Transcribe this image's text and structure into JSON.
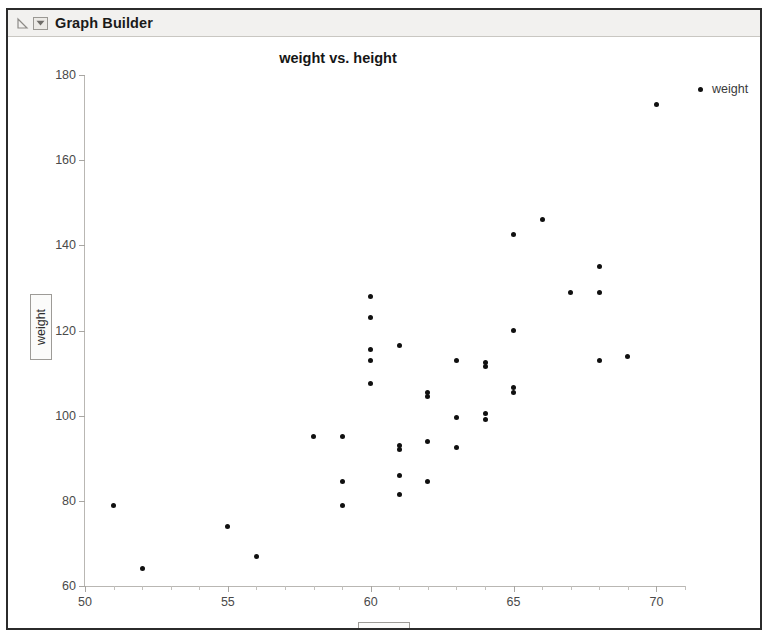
{
  "window": {
    "title": "Graph Builder",
    "disclosure_icon": "disclosure-triangle-icon",
    "popup_menu_icon": "red-triangle-popup-icon"
  },
  "chart_data": {
    "type": "scatter",
    "title": "weight vs. height",
    "xlabel": "height",
    "ylabel": "weight",
    "xlim": [
      50,
      71
    ],
    "ylim": [
      60,
      180
    ],
    "xticks": [
      50,
      55,
      60,
      65,
      70
    ],
    "yticks": [
      60,
      80,
      100,
      120,
      140,
      160,
      180
    ],
    "x_minor_tick_step": 1,
    "grid": false,
    "legend": {
      "position": "right",
      "entries": [
        {
          "name": "weight",
          "marker": "filled-circle",
          "color": "#101010"
        }
      ]
    },
    "series": [
      {
        "name": "weight",
        "color": "#101010",
        "points": [
          [
            51,
            79
          ],
          [
            52,
            64
          ],
          [
            55,
            74
          ],
          [
            56,
            67
          ],
          [
            58,
            95
          ],
          [
            59,
            95
          ],
          [
            59,
            79
          ],
          [
            59,
            84.5
          ],
          [
            60,
            128
          ],
          [
            60,
            123
          ],
          [
            60,
            113
          ],
          [
            60,
            115.5
          ],
          [
            60,
            107.5
          ],
          [
            61,
            116.5
          ],
          [
            61,
            81.5
          ],
          [
            61,
            86
          ],
          [
            61,
            92
          ],
          [
            61,
            93
          ],
          [
            62,
            104.5
          ],
          [
            62,
            105.5
          ],
          [
            62,
            84.5
          ],
          [
            62,
            94
          ],
          [
            63,
            92.5
          ],
          [
            63,
            113
          ],
          [
            63,
            99.5
          ],
          [
            64,
            100.5
          ],
          [
            64,
            111.5
          ],
          [
            64,
            112.5
          ],
          [
            64,
            99
          ],
          [
            65,
            142.5
          ],
          [
            65,
            120
          ],
          [
            65,
            105.5
          ],
          [
            65,
            106.5
          ],
          [
            66,
            146
          ],
          [
            67,
            129
          ],
          [
            68,
            135
          ],
          [
            68,
            129
          ],
          [
            68,
            113
          ],
          [
            69,
            114
          ],
          [
            70,
            173
          ]
        ]
      }
    ]
  }
}
